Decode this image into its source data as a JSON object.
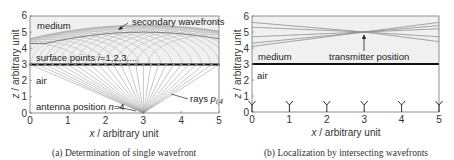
{
  "chart_data": [
    {
      "type": "line",
      "panel": "a",
      "caption": "(a) Determination of single wavefront",
      "xlabel": "x / arbitrary unit",
      "ylabel": "z / arbitrary unit",
      "xlim": [
        0,
        5
      ],
      "ylim": [
        0,
        6
      ],
      "xticks": [
        "0",
        "1",
        "2",
        "3",
        "4",
        "5"
      ],
      "yticks": [
        "0",
        "1",
        "2",
        "3",
        "4",
        "5",
        "6"
      ],
      "grid": false,
      "regions": [
        {
          "name": "medium",
          "z_range": [
            3,
            6
          ],
          "fill": "#efefef"
        },
        {
          "name": "air",
          "z_range": [
            0,
            3
          ],
          "fill": "#ffffff"
        }
      ],
      "interface_z": 3,
      "antenna": {
        "x": 3,
        "z": 0,
        "label": "antenna position n=4"
      },
      "surface_points": {
        "label": "surface points i=1,2,3,...",
        "x_start": 0,
        "x_end": 5,
        "spacing": 0.2,
        "z": 3
      },
      "rays_label": "rays p_i,4",
      "secondary_wavefronts_label": "secondary wavefronts",
      "envelope_peak": {
        "x": 3,
        "z": 5
      },
      "annotations": [
        "medium",
        "secondary wavefronts",
        "surface points i=1,2,3,...",
        "air",
        "antenna position n=4",
        "rays p_i,4"
      ]
    },
    {
      "type": "line",
      "panel": "b",
      "caption": "(b) Localization by intersecting wavefronts",
      "xlabel": "x / arbitrary unit",
      "ylabel": "z / arbitrary unit",
      "xlim": [
        0,
        5
      ],
      "ylim": [
        0,
        6
      ],
      "xticks": [
        "0",
        "1",
        "2",
        "3",
        "4",
        "5"
      ],
      "yticks": [
        "0",
        "1",
        "2",
        "3",
        "4",
        "5",
        "6"
      ],
      "grid": false,
      "interface_z": 3,
      "antennas_x": [
        0,
        1,
        2,
        3,
        4,
        5
      ],
      "transmitter": {
        "x": 3,
        "z": 5,
        "label": "transmitter position"
      },
      "wavefronts": [
        {
          "z_at_x0": 4.1,
          "z_at_x5": 5.6
        },
        {
          "z_at_x0": 4.3,
          "z_at_x5": 5.4
        },
        {
          "z_at_x0": 4.7,
          "z_at_x5": 5.2
        },
        {
          "z_at_x0": 5.3,
          "z_at_x5": 4.7
        },
        {
          "z_at_x0": 5.6,
          "z_at_x5": 4.4
        }
      ],
      "annotations": [
        "medium",
        "transmitter position",
        "air"
      ]
    }
  ],
  "panel_a": {
    "caption": "(a) Determination of single wavefront",
    "xlabel_var": "x",
    "xlabel_rest": " / arbitrary unit",
    "ylabel_var": "z",
    "ylabel_rest": " / arbitrary unit",
    "medium": "medium",
    "secondary": "secondary wavefronts",
    "surface_a": "surface points ",
    "surface_i": "i",
    "surface_b": "=1,2,3,...",
    "air": "air",
    "antenna_a": "antenna position ",
    "antenna_n": "n",
    "antenna_b": "=4",
    "rays_a": "rays ",
    "rays_p": "p",
    "rays_sub": "i,4",
    "xticks": [
      "0",
      "1",
      "2",
      "3",
      "4",
      "5"
    ],
    "yticks": [
      "0",
      "1",
      "2",
      "3",
      "4",
      "5",
      "6"
    ]
  },
  "panel_b": {
    "caption": "(b) Localization by intersecting wavefronts",
    "xlabel_var": "x",
    "xlabel_rest": " / arbitrary unit",
    "ylabel_var": "z",
    "ylabel_rest": " / arbitrary unit",
    "medium": "medium",
    "transmitter": "transmitter position",
    "air": "air",
    "xticks": [
      "0",
      "1",
      "2",
      "3",
      "4",
      "5"
    ],
    "yticks": [
      "0",
      "1",
      "2",
      "3",
      "4",
      "5",
      "6"
    ]
  }
}
